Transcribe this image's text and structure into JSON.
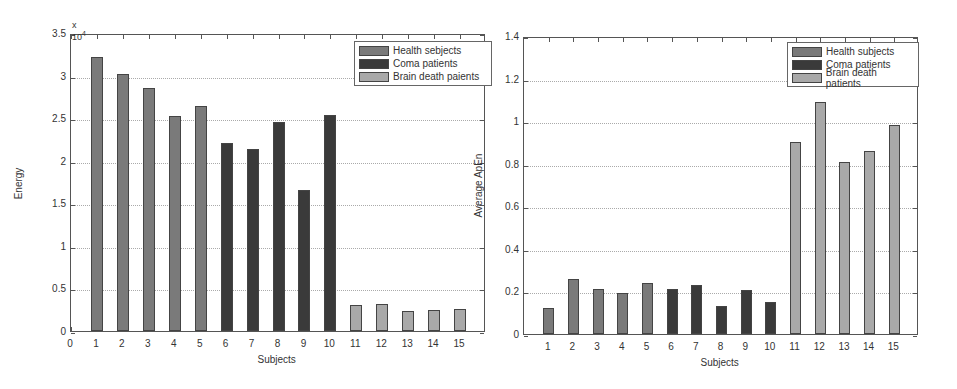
{
  "colors": {
    "health": "#7a7a7a",
    "coma": "#3a3a3a",
    "brain_death": "#a9a9a9"
  },
  "chart_data": [
    {
      "type": "bar",
      "title": "",
      "xlabel": "Subjects",
      "ylabel": "Energy",
      "y_multiplier": "x 10",
      "y_multiplier_exp": "4",
      "ylim": [
        0,
        3.5
      ],
      "xlim": [
        0,
        16
      ],
      "grid": true,
      "legend_position": "upper right",
      "x_ticks": [
        "0",
        "1",
        "2",
        "3",
        "4",
        "5",
        "6",
        "7",
        "8",
        "9",
        "10",
        "11",
        "12",
        "13",
        "14",
        "15"
      ],
      "y_ticks": [
        "0",
        "0.5",
        "1",
        "1.5",
        "2",
        "2.5",
        "3",
        "3.5"
      ],
      "legend": [
        "Health sebjects",
        "Coma patients",
        "Brain death paients"
      ],
      "categories": [
        1,
        2,
        3,
        4,
        5,
        6,
        7,
        8,
        9,
        10,
        11,
        12,
        13,
        14,
        15
      ],
      "series": [
        {
          "name": "Health sebjects",
          "x": [
            1,
            2,
            3,
            4,
            5
          ],
          "values": [
            3.22,
            3.02,
            2.86,
            2.53,
            2.64
          ]
        },
        {
          "name": "Coma patients",
          "x": [
            6,
            7,
            8,
            9,
            10
          ],
          "values": [
            2.21,
            2.14,
            2.45,
            1.66,
            2.54
          ]
        },
        {
          "name": "Brain death paients",
          "x": [
            11,
            12,
            13,
            14,
            15
          ],
          "values": [
            0.31,
            0.32,
            0.24,
            0.25,
            0.26
          ]
        }
      ]
    },
    {
      "type": "bar",
      "title": "",
      "xlabel": "Subjects",
      "ylabel": "Average ApEn",
      "ylim": [
        0,
        1.4
      ],
      "xlim": [
        0,
        16
      ],
      "grid": true,
      "legend_position": "upper right",
      "x_ticks": [
        "1",
        "2",
        "3",
        "4",
        "5",
        "6",
        "7",
        "8",
        "9",
        "10",
        "11",
        "12",
        "13",
        "14",
        "15"
      ],
      "y_ticks": [
        "0",
        "0.2",
        "0.4",
        "0.6",
        "0.8",
        "1",
        "1.2",
        "1.4"
      ],
      "legend": [
        "Health subjects",
        "Coma patients",
        "Brain death patients"
      ],
      "categories": [
        1,
        2,
        3,
        4,
        5,
        6,
        7,
        8,
        9,
        10,
        11,
        12,
        13,
        14,
        15
      ],
      "series": [
        {
          "name": "Health subjects",
          "x": [
            1,
            2,
            3,
            4,
            5
          ],
          "values": [
            0.12,
            0.26,
            0.21,
            0.195,
            0.24
          ]
        },
        {
          "name": "Coma patients",
          "x": [
            6,
            7,
            8,
            9,
            10
          ],
          "values": [
            0.21,
            0.23,
            0.13,
            0.205,
            0.15
          ]
        },
        {
          "name": "Brain death patients",
          "x": [
            11,
            12,
            13,
            14,
            15
          ],
          "values": [
            0.9,
            1.09,
            0.81,
            0.86,
            0.98
          ]
        }
      ]
    }
  ]
}
